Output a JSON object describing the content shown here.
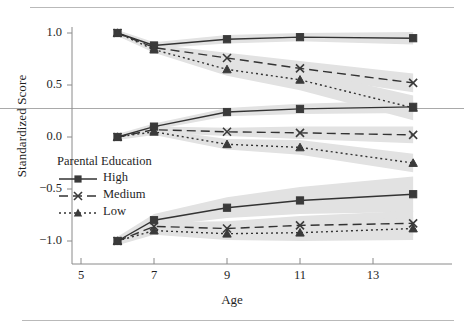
{
  "chart_data": {
    "type": "line",
    "title": "",
    "xlabel": "Age",
    "ylabel": "Standardized Score",
    "xlim": [
      4.3,
      14.9
    ],
    "ylim": [
      -1.18,
      1.18
    ],
    "xticks": [
      5,
      7,
      9,
      11,
      13
    ],
    "xtick_labels": [
      "5",
      "7",
      "9",
      "11",
      "13"
    ],
    "yticks": [
      1.0,
      0.5,
      0.0,
      -0.5,
      -1.0
    ],
    "ytick_labels": [
      "1.0",
      "0.5",
      "0.0",
      "−0.5",
      "−1.0"
    ],
    "grid": false,
    "legend": {
      "title": "Parental Education",
      "position": "inside-lower-left",
      "entries": [
        {
          "label": "High",
          "marker": "square",
          "line": "solid"
        },
        {
          "label": "Medium",
          "marker": "x",
          "line": "dashed"
        },
        {
          "label": "Low",
          "marker": "triangle",
          "line": "dotted"
        }
      ]
    },
    "reference_line": {
      "y": 0.28,
      "orientation": "horizontal"
    },
    "x": [
      6,
      7,
      9,
      11,
      14.1
    ],
    "panels": [
      {
        "name": "upper",
        "series": [
          {
            "name": "High",
            "values": [
              1.0,
              0.88,
              0.94,
              0.96,
              0.95
            ],
            "band_low": [
              0.97,
              0.85,
              0.9,
              0.92,
              0.89
            ],
            "band_high": [
              1.03,
              0.91,
              0.98,
              1.0,
              1.01
            ]
          },
          {
            "name": "Medium",
            "values": [
              1.0,
              0.86,
              0.76,
              0.66,
              0.52
            ],
            "band_low": [
              0.97,
              0.83,
              0.71,
              0.59,
              0.43
            ],
            "band_high": [
              1.03,
              0.89,
              0.81,
              0.73,
              0.61
            ]
          },
          {
            "name": "Low",
            "values": [
              1.0,
              0.84,
              0.65,
              0.55,
              0.28
            ],
            "band_low": [
              0.97,
              0.81,
              0.59,
              0.45,
              0.16
            ],
            "band_high": [
              1.03,
              0.87,
              0.71,
              0.65,
              0.4
            ]
          }
        ]
      },
      {
        "name": "middle",
        "series": [
          {
            "name": "High",
            "values": [
              0.0,
              0.1,
              0.24,
              0.27,
              0.29
            ],
            "band_low": [
              -0.03,
              0.07,
              0.2,
              0.22,
              0.23
            ],
            "band_high": [
              0.03,
              0.13,
              0.28,
              0.32,
              0.35
            ]
          },
          {
            "name": "Medium",
            "values": [
              0.0,
              0.07,
              0.05,
              0.04,
              0.02
            ],
            "band_low": [
              -0.03,
              0.04,
              0.01,
              -0.02,
              -0.06
            ],
            "band_high": [
              0.03,
              0.1,
              0.09,
              0.1,
              0.1
            ]
          },
          {
            "name": "Low",
            "values": [
              0.0,
              0.05,
              -0.07,
              -0.1,
              -0.25
            ],
            "band_low": [
              -0.03,
              0.02,
              -0.12,
              -0.17,
              -0.34
            ],
            "band_high": [
              0.03,
              0.08,
              -0.02,
              -0.03,
              -0.16
            ]
          }
        ]
      },
      {
        "name": "lower",
        "series": [
          {
            "name": "High",
            "values": [
              -1.0,
              -0.8,
              -0.68,
              -0.61,
              -0.55
            ],
            "band_low": [
              -1.04,
              -0.86,
              -0.78,
              -0.74,
              -0.72
            ],
            "band_high": [
              -0.96,
              -0.74,
              -0.58,
              -0.48,
              -0.38
            ]
          },
          {
            "name": "Medium",
            "values": [
              -1.0,
              -0.86,
              -0.88,
              -0.85,
              -0.83
            ],
            "band_low": [
              -1.04,
              -0.9,
              -0.95,
              -0.94,
              -0.95
            ],
            "band_high": [
              -0.96,
              -0.82,
              -0.81,
              -0.76,
              -0.71
            ]
          },
          {
            "name": "Low",
            "values": [
              -1.0,
              -0.9,
              -0.93,
              -0.92,
              -0.88
            ],
            "band_low": [
              -1.04,
              -0.94,
              -0.99,
              -1.0,
              -0.99
            ],
            "band_high": [
              -0.96,
              -0.86,
              -0.87,
              -0.84,
              -0.77
            ]
          }
        ]
      }
    ],
    "colors": {
      "line": "#333333",
      "marker": "#3a3a3a",
      "band": "#e2e2e2",
      "axis": "#8a8a8a",
      "reference_line": "#a9a9a9",
      "text": "#1f1f1f"
    }
  }
}
